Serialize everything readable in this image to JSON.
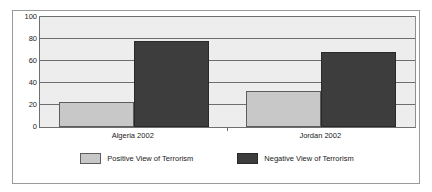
{
  "chart_data": {
    "type": "bar",
    "title": "",
    "subtitle": "",
    "xlabel": "",
    "ylabel": "",
    "categories": [
      "Algeria 2002",
      "Jordan 2002"
    ],
    "series": [
      {
        "name": "Positive View of Terrorism",
        "color": "#c8c8c8",
        "values": [
          23,
          33
        ]
      },
      {
        "name": "Negative View of Terrorism",
        "color": "#3d3d3d",
        "values": [
          78,
          68
        ]
      }
    ],
    "ylim": [
      0,
      100
    ],
    "ytick_labels": [
      "100",
      "80",
      "60",
      "40",
      "20",
      "0"
    ],
    "ytick_values": [
      100,
      80,
      60,
      40,
      20,
      0
    ],
    "grid": true,
    "grid_orientation": "horizontal",
    "legend_position": "bottom",
    "plot_background": "#ededed",
    "figure_background": "#ffffff",
    "border_color": "#9a9a9a",
    "axis_color": "#6e6e6e",
    "annotations": []
  }
}
